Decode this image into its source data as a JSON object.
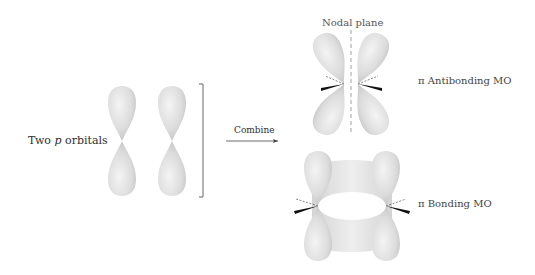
{
  "labels": {
    "two_p_prefix": "Two ",
    "two_p_italic": "p",
    "two_p_suffix": " orbitals",
    "combine": "Combine",
    "nodal_plane": "Nodal plane",
    "antibonding": "π Antibonding MO",
    "bonding": "π Bonding MO"
  },
  "colors": {
    "lobe_light": "#efefef",
    "lobe_dark": "#bdbdbd",
    "line": "#555555",
    "background": "#ffffff"
  }
}
